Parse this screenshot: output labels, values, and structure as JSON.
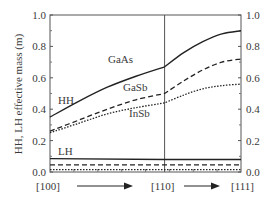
{
  "chart_data": {
    "type": "line",
    "title": "",
    "xlabel": "",
    "ylabel": "HH, LH effective mass (m)",
    "ylim": [
      0.0,
      1.0
    ],
    "yticks": [
      "0.0",
      "0.2",
      "0.4",
      "0.6",
      "0.8",
      "1.0"
    ],
    "right_yticks": [
      "0.0",
      "0.2",
      "0.4",
      "0.6",
      "0.8",
      "1.0"
    ],
    "x_labels": [
      "[100]",
      "[110]",
      "[111]"
    ],
    "x_positions": [
      0,
      0.6,
      1.0
    ],
    "grid": false,
    "legend": "inline labels",
    "annotations": [
      "GaAs",
      "GaSb",
      "InSb",
      "HH",
      "LH"
    ],
    "series": [
      {
        "name": "GaAs HH",
        "style": "solid",
        "x": [
          0,
          0.15,
          0.3,
          0.45,
          0.6,
          0.7,
          0.8,
          0.9,
          1.0
        ],
        "values": [
          0.35,
          0.45,
          0.54,
          0.61,
          0.67,
          0.76,
          0.83,
          0.88,
          0.9
        ]
      },
      {
        "name": "GaSb HH",
        "style": "dashed",
        "x": [
          0,
          0.15,
          0.3,
          0.45,
          0.6,
          0.7,
          0.8,
          0.9,
          1.0
        ],
        "values": [
          0.26,
          0.33,
          0.4,
          0.46,
          0.5,
          0.58,
          0.65,
          0.7,
          0.72
        ]
      },
      {
        "name": "InSb HH",
        "style": "dotted",
        "x": [
          0,
          0.15,
          0.3,
          0.45,
          0.6,
          0.7,
          0.8,
          0.9,
          1.0
        ],
        "values": [
          0.25,
          0.31,
          0.37,
          0.41,
          0.44,
          0.49,
          0.53,
          0.55,
          0.56
        ]
      },
      {
        "name": "GaAs LH",
        "style": "solid",
        "x": [
          0,
          0.6,
          1.0
        ],
        "values": [
          0.085,
          0.08,
          0.08
        ]
      },
      {
        "name": "GaSb LH",
        "style": "dashed",
        "x": [
          0,
          0.6,
          1.0
        ],
        "values": [
          0.045,
          0.045,
          0.045
        ]
      },
      {
        "name": "InSb LH",
        "style": "dotted",
        "x": [
          0,
          0.6,
          1.0
        ],
        "values": [
          0.015,
          0.015,
          0.015
        ]
      }
    ]
  },
  "labels": {
    "gaas": "GaAs",
    "gasb": "GaSb",
    "insb": "InSb",
    "hh": "HH",
    "lh": "LH",
    "ylabel": "HH, LH effective mass (m)",
    "x100": "[100]",
    "x110": "[110]",
    "x111": "[111]"
  }
}
